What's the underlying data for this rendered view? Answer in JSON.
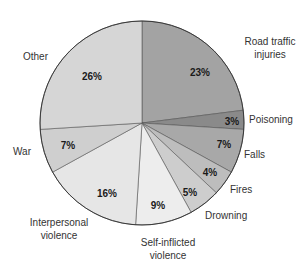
{
  "chart_data": {
    "type": "pie",
    "title": "",
    "start_angle": "12 o'clock",
    "direction": "clockwise",
    "categories": [
      "Road traffic injuries",
      "Poisoning",
      "Falls",
      "Fires",
      "Drowning",
      "Self-inflicted violence",
      "Interpersonal violence",
      "War",
      "Other"
    ],
    "values": [
      23,
      3,
      7,
      4,
      5,
      9,
      16,
      7,
      26
    ],
    "value_labels": [
      "23%",
      "3%",
      "7%",
      "4%",
      "5%",
      "9%",
      "16%",
      "7%",
      "26%"
    ],
    "colors": [
      "#a3a3a3",
      "#8a8a8a",
      "#a8a8a8",
      "#bdbdbd",
      "#cdcdcd",
      "#ededed",
      "#e6e6e6",
      "#cfcfcf",
      "#d6d6d6"
    ],
    "legend": "none (slice labels outside)",
    "slices": [
      {
        "name": "Road traffic injuries",
        "label_lines": [
          "Road traffic",
          "injuries"
        ],
        "pct_label": "23%",
        "value": 23,
        "color": "#a3a3a3",
        "pct_pos": [
          200,
          76
        ],
        "label_pos": [
          270,
          45
        ],
        "label_anchor": "middle"
      },
      {
        "name": "Poisoning",
        "label_lines": [
          "Poisoning"
        ],
        "pct_label": "3%",
        "value": 3,
        "color": "#8a8a8a",
        "pct_pos": [
          232,
          125
        ],
        "label_pos": [
          249,
          123
        ],
        "label_anchor": "start"
      },
      {
        "name": "Falls",
        "label_lines": [
          "Falls"
        ],
        "pct_label": "7%",
        "value": 7,
        "color": "#a8a8a8",
        "pct_pos": [
          224,
          148
        ],
        "label_pos": [
          244,
          158
        ],
        "label_anchor": "start"
      },
      {
        "name": "Fires",
        "label_lines": [
          "Fires"
        ],
        "pct_label": "4%",
        "value": 4,
        "color": "#bdbdbd",
        "pct_pos": [
          210,
          176
        ],
        "label_pos": [
          230,
          193
        ],
        "label_anchor": "start"
      },
      {
        "name": "Drowning",
        "label_lines": [
          "Drowning"
        ],
        "pct_label": "5%",
        "value": 5,
        "color": "#cdcdcd",
        "pct_pos": [
          190,
          196
        ],
        "label_pos": [
          205,
          219
        ],
        "label_anchor": "start"
      },
      {
        "name": "Self-inflicted violence",
        "label_lines": [
          "Self-inflicted",
          "violence"
        ],
        "pct_label": "9%",
        "value": 9,
        "color": "#ededed",
        "pct_pos": [
          158,
          209
        ],
        "label_pos": [
          168,
          246
        ],
        "label_anchor": "middle"
      },
      {
        "name": "Interpersonal violence",
        "label_lines": [
          "Interpersonal",
          "violence"
        ],
        "pct_label": "16%",
        "value": 16,
        "color": "#e6e6e6",
        "pct_pos": [
          107,
          197
        ],
        "label_pos": [
          59,
          226
        ],
        "label_anchor": "middle"
      },
      {
        "name": "War",
        "label_lines": [
          "War"
        ],
        "pct_label": "7%",
        "value": 7,
        "color": "#cfcfcf",
        "pct_pos": [
          68,
          149
        ],
        "label_pos": [
          13,
          155
        ],
        "label_anchor": "start"
      },
      {
        "name": "Other",
        "label_lines": [
          "Other"
        ],
        "pct_label": "26%",
        "value": 26,
        "color": "#d6d6d6",
        "pct_pos": [
          92,
          80
        ],
        "label_pos": [
          23,
          60
        ],
        "label_anchor": "start"
      }
    ]
  }
}
